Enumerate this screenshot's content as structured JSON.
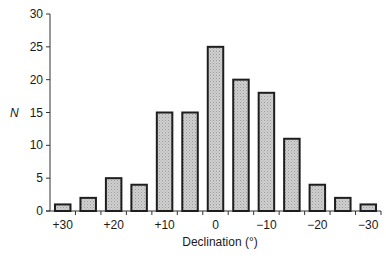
{
  "chart_data": {
    "type": "bar",
    "title": "",
    "xlabel": "Declination (°)",
    "ylabel": "N",
    "ylim": [
      0,
      30
    ],
    "yticks": [
      0,
      5,
      10,
      15,
      20,
      25,
      30
    ],
    "xtick_labels": [
      "+30",
      "+20",
      "+10",
      "0",
      "−10",
      "−20",
      "−30"
    ],
    "categories": [
      "+30",
      "+25",
      "+20",
      "+15",
      "+10",
      "+5",
      "0",
      "−5",
      "−10",
      "−15",
      "−20",
      "−25",
      "−30"
    ],
    "values": [
      1,
      2,
      5,
      4,
      15,
      15,
      25,
      20,
      18,
      11,
      4,
      2,
      1
    ],
    "grid": false,
    "legend": null
  },
  "style": {
    "bar_fill": "#c6c6c6",
    "bar_stroke": "#1e1e1e",
    "axis_color": "#333333",
    "background": "#ffffff"
  }
}
